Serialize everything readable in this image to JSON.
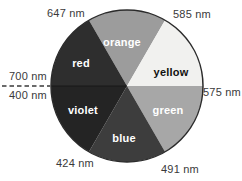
{
  "wheel": {
    "outline_color": "#2b2b2b",
    "sectors": [
      {
        "name": "orange",
        "label": "orange",
        "color": "#9c9c9c",
        "label_color": "#ffffff"
      },
      {
        "name": "yellow",
        "label": "yellow",
        "color": "#f1f1ef",
        "label_color": "#111111"
      },
      {
        "name": "green",
        "label": "green",
        "color": "#a7a7a7",
        "label_color": "#ffffff"
      },
      {
        "name": "blue",
        "label": "blue",
        "color": "#3d3d3d",
        "label_color": "#ffffff"
      },
      {
        "name": "violet",
        "label": "violet",
        "color": "#242424",
        "label_color": "#ffffff"
      },
      {
        "name": "red",
        "label": "red",
        "color": "#2e2e2e",
        "label_color": "#ffffff"
      }
    ]
  },
  "wavelengths": {
    "red_orange_boundary": "647 nm",
    "orange_yellow_boundary": "585 nm",
    "red_end": "700 nm",
    "violet_end": "400 nm",
    "yellow_green_boundary": "575 nm",
    "violet_blue_boundary": "424 nm",
    "blue_green_boundary": "491 nm"
  }
}
